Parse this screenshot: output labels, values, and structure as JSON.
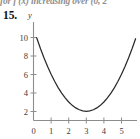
{
  "page": {
    "clipped_header_text": "for  f (x) increasing over (0, 2",
    "exercise_number": "15."
  },
  "chart_data": {
    "type": "line",
    "title": "",
    "xlabel": "",
    "ylabel": "y",
    "axis_labels": {
      "x": "",
      "y": "y"
    },
    "xlim": [
      -0.25,
      5.85
    ],
    "ylim": [
      -0.6,
      11.2
    ],
    "xticks": [
      0,
      1,
      2,
      3,
      4,
      5
    ],
    "xticklabels": [
      "0",
      "1",
      "2",
      "3",
      "4",
      "5"
    ],
    "yticks": [
      2,
      4,
      6,
      8,
      10
    ],
    "yticklabels": [
      "2",
      "4",
      "6",
      "8",
      "10"
    ],
    "grid": false,
    "legend": false,
    "curve_color": "#2b2b2b",
    "axis_color": "#8d8d8d",
    "equation": "y = (x - 3)^2 + 1",
    "vertex": [
      3,
      1
    ],
    "series": [
      {
        "name": "parabola",
        "x": [
          0.18,
          0.4,
          0.6,
          0.8,
          1.0,
          1.2,
          1.4,
          1.6,
          1.8,
          2.0,
          2.2,
          2.4,
          2.6,
          2.8,
          3.0,
          3.2,
          3.4,
          3.6,
          3.8,
          4.0,
          4.2,
          4.4,
          4.6,
          4.8,
          5.0,
          5.2,
          5.4,
          5.6,
          5.8
        ],
        "y": [
          8.95,
          7.76,
          6.76,
          5.84,
          5.0,
          4.24,
          3.56,
          2.96,
          2.44,
          2.0,
          1.64,
          1.36,
          1.16,
          1.04,
          1.0,
          1.04,
          1.16,
          1.36,
          1.64,
          2.0,
          2.44,
          2.96,
          3.56,
          4.24,
          5.0,
          5.84,
          6.76,
          7.76,
          8.84
        ]
      }
    ]
  }
}
